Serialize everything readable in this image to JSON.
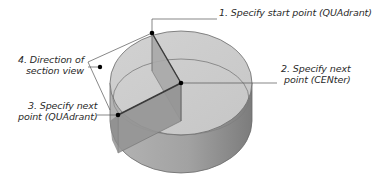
{
  "diagram": {
    "labels": {
      "step1": {
        "line1": "1. Specify start point (QUAdrant)"
      },
      "step2": {
        "line1": "2. Specify next",
        "line2": "point (CENter)"
      },
      "step3": {
        "line1": "3. Specify next",
        "line2": "point (QUAdrant)"
      },
      "step4": {
        "line1": "4. Direction of",
        "line2": "section view"
      }
    },
    "colors": {
      "top_face": "#cfcfcf",
      "side_face": "#9a9a9a",
      "side_shadow": "#7d7d7d",
      "cut_plane": "#a9a9a9",
      "cut_plane_dark": "#8f8f8f",
      "outline": "#6a6a6a",
      "leader": "#555555",
      "point": "#000000"
    }
  }
}
